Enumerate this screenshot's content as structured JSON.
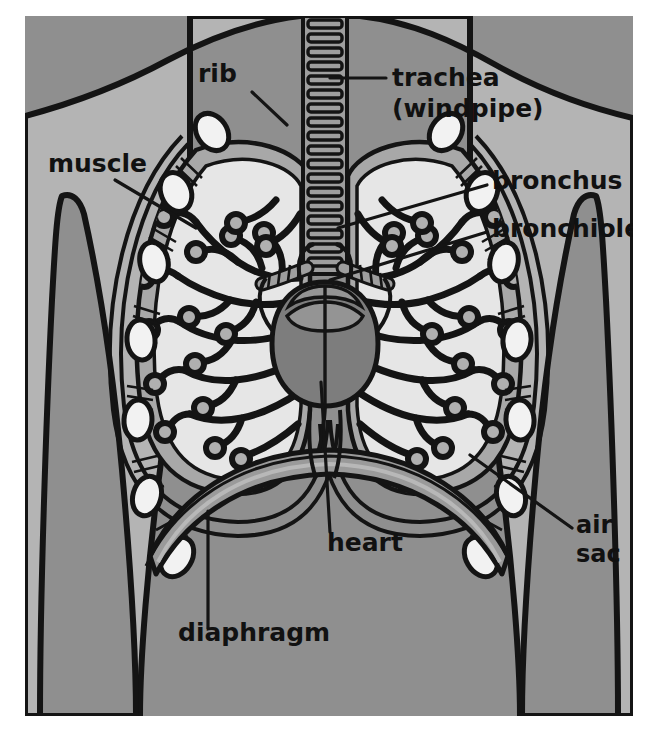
{
  "figure": {
    "style": "hand-drawn grayscale anatomical illustration",
    "canvas": {
      "width": 658,
      "height": 744
    }
  },
  "palette": {
    "page_white": "#ffffff",
    "outside_body_gray": "#8f8f8f",
    "body_interior_gray": "#b4b4b4",
    "lung_field_light": "#e6e6e6",
    "lung_tissue_mid": "#a8a8a8",
    "heart_dark": "#7d7d7d",
    "heart_chamber": "#949494",
    "trachea_fill": "#9e9e9e",
    "diaphragm_band": "#9a9a9a",
    "rib_white": "#f2f2f2",
    "ink_black": "#141414"
  },
  "labels": [
    {
      "id": "rib",
      "text": "rib",
      "x": 198,
      "y": 82,
      "anchor": "start",
      "size": "lg"
    },
    {
      "id": "trachea",
      "text": "trachea",
      "x": 392,
      "y": 86,
      "anchor": "start",
      "size": "lg"
    },
    {
      "id": "windpipe",
      "text": "(windpipe)",
      "x": 392,
      "y": 117,
      "anchor": "start",
      "size": "lg"
    },
    {
      "id": "muscle",
      "text": "muscle",
      "x": 48,
      "y": 172,
      "anchor": "start",
      "size": "lg"
    },
    {
      "id": "bronchus",
      "text": "bronchus",
      "x": 492,
      "y": 189,
      "anchor": "start",
      "size": "lg"
    },
    {
      "id": "bronchiole",
      "text": "bronchiole",
      "x": 492,
      "y": 237,
      "anchor": "start",
      "size": "lg"
    },
    {
      "id": "air",
      "text": "air",
      "x": 576,
      "y": 533,
      "anchor": "start",
      "size": "md"
    },
    {
      "id": "sac",
      "text": "sac",
      "x": 576,
      "y": 562,
      "anchor": "start",
      "size": "md"
    },
    {
      "id": "heart",
      "text": "heart",
      "x": 327,
      "y": 551,
      "anchor": "start",
      "size": "lg"
    },
    {
      "id": "diaphragm",
      "text": "diaphragm",
      "x": 178,
      "y": 641,
      "anchor": "start",
      "size": "lg"
    }
  ],
  "leader_lines": [
    {
      "id": "rib-leader",
      "points": "252,92 287,125"
    },
    {
      "id": "trachea-leader",
      "points": "386,78 330,78"
    },
    {
      "id": "muscle-leader",
      "points": "115,180 196,228"
    },
    {
      "id": "bronchus-leader",
      "points": "487,185 338,228"
    },
    {
      "id": "bronchiole-leader",
      "points": "487,232 330,280"
    },
    {
      "id": "airsac-leader",
      "points": "572,528 470,455"
    },
    {
      "id": "heart-leader",
      "points": "330,532 321,382"
    },
    {
      "id": "diaphragm-leader",
      "points": "208,628 208,511"
    }
  ],
  "parts": [
    {
      "id": "trachea",
      "name": "trachea (windpipe)",
      "description": "vertical segmented cartilage tube at center top"
    },
    {
      "id": "bronchus",
      "name": "bronchus",
      "description": "main airway branching left and right from trachea base"
    },
    {
      "id": "bronchiole",
      "name": "bronchiole",
      "description": "fine branching airways filling each lung"
    },
    {
      "id": "air-sac",
      "name": "air sac",
      "description": "bulbous alveolar terminals at bronchiole tips"
    },
    {
      "id": "rib",
      "name": "rib",
      "description": "white oval bone cross-sections around chest wall"
    },
    {
      "id": "muscle",
      "name": "muscle",
      "description": "hatched intercostal fibers between ribs"
    },
    {
      "id": "heart",
      "name": "heart",
      "description": "dark oval organ with chambers between the lungs"
    },
    {
      "id": "diaphragm",
      "name": "diaphragm",
      "description": "dome-shaped muscle band below the lungs"
    },
    {
      "id": "left-lung",
      "name": "left lung",
      "description": "lung field left of midline"
    },
    {
      "id": "right-lung",
      "name": "right lung",
      "description": "lung field right of midline"
    }
  ]
}
